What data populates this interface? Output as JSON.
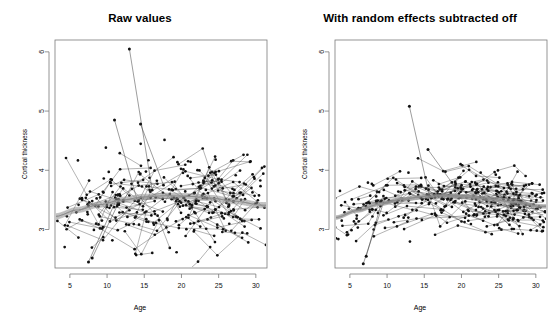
{
  "figure": {
    "background": "#ffffff",
    "point_color": "#111111",
    "line_color": "#3a3a3a",
    "frame_color": "#7a7a7a",
    "fit_color": "#8c8c8c"
  },
  "panels": [
    {
      "id": "raw-values",
      "title": "Raw values",
      "xlabel": "Age",
      "ylabel": "Cortical thickness"
    },
    {
      "id": "random-effects-subtracted",
      "title": "With random effects subtracted off",
      "xlabel": "Age",
      "ylabel": "Cortical thickness"
    }
  ],
  "chart_data": {
    "type": "scatter",
    "layout": "two side-by-side panels sharing identical axes",
    "xlabel": "Age",
    "ylabel": "Cortical thickness",
    "xlim": [
      3,
      31.5
    ],
    "ylim": [
      2.35,
      6.2
    ],
    "xticks": [
      5,
      10,
      15,
      20,
      25,
      30
    ],
    "yticks": [
      3,
      4,
      5,
      6
    ],
    "grid": false,
    "legend": null,
    "panels": [
      {
        "name": "Raw values",
        "n_points": 620,
        "n_subjects": 190,
        "point_spread_sd": 0.4,
        "mean_level": 3.45,
        "fit": {
          "style": "smooth band of grey fitted curves",
          "x": [
            3,
            6,
            9,
            12,
            15,
            18,
            21,
            24,
            27,
            31
          ],
          "y": [
            3.22,
            3.33,
            3.42,
            3.5,
            3.55,
            3.57,
            3.56,
            3.53,
            3.48,
            3.41
          ],
          "band_halfwidth": 0.045
        },
        "notable_points": [
          {
            "x": 13.0,
            "y": 6.05,
            "note": "high outlier joined to cluster"
          },
          {
            "x": 11.0,
            "y": 4.85
          },
          {
            "x": 14.5,
            "y": 4.78
          },
          {
            "x": 7.5,
            "y": 2.45,
            "note": "low outlier"
          },
          {
            "x": 8.0,
            "y": 2.52
          }
        ]
      },
      {
        "name": "With random effects subtracted off",
        "n_points": 620,
        "n_subjects": 190,
        "point_spread_sd": 0.26,
        "mean_level": 3.45,
        "fit": {
          "style": "solid and dashed grey fitted lines fanning at right",
          "x": [
            3,
            6,
            9,
            12,
            15,
            18,
            21,
            24,
            27,
            31
          ],
          "y": [
            3.2,
            3.32,
            3.43,
            3.51,
            3.56,
            3.57,
            3.55,
            3.51,
            3.46,
            3.39
          ],
          "band_halfwidth": 0.03
        },
        "notable_points": [
          {
            "x": 13.0,
            "y": 5.08,
            "note": "high outlier joined to cluster"
          },
          {
            "x": 15.5,
            "y": 4.35
          },
          {
            "x": 6.8,
            "y": 2.42,
            "note": "low outlier"
          },
          {
            "x": 7.2,
            "y": 2.55
          }
        ]
      }
    ]
  }
}
